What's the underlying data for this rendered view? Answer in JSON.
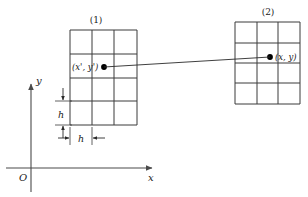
{
  "figure": {
    "background_color": "#ffffff",
    "line_color": "#3a3a3a",
    "axis_color": "#4a4a4a",
    "text_color": "#1a1a1a",
    "dot_color": "#000000"
  },
  "axes": {
    "y_label": "y",
    "x_label": "x",
    "origin_label": "O"
  },
  "boxes": [
    {
      "id": "box-1",
      "caption": "(1)",
      "columns": 3,
      "rows": 4,
      "point_label": "(x', y')"
    },
    {
      "id": "box-2",
      "caption": "(2)",
      "columns": 3,
      "rows": 4,
      "point_label": "(x, y)"
    }
  ],
  "dimensions": {
    "vertical_spacing_label": "h",
    "horizontal_spacing_label": "h"
  }
}
